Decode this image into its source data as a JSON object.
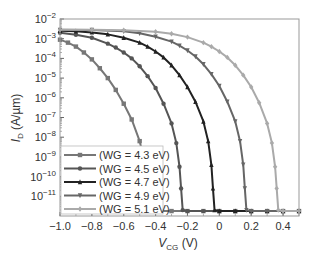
{
  "chart_data": {
    "type": "line",
    "title": "",
    "xlabel": "V",
    "xlabel_sub": "CG",
    "xlabel_unit": " (V)",
    "ylabel": "I",
    "ylabel_sub": "D",
    "ylabel_unit": " (A/µm)",
    "xlim": [
      -1.0,
      0.5
    ],
    "ylim_log10": [
      -12,
      -2
    ],
    "yscale": "log",
    "grid": false,
    "legend_position": "bottom-left",
    "x_ticks": [
      -1.0,
      -0.8,
      -0.6,
      -0.4,
      -0.2,
      0,
      0.2,
      0.4
    ],
    "x_tick_labels": [
      "−1.0",
      "−0.8",
      "−0.6",
      "−0.4",
      "−0.2",
      "0",
      "0.2",
      "0.4"
    ],
    "y_ticks_log10": [
      -2,
      -3,
      -4,
      -5,
      -6,
      -7,
      -8,
      -9,
      -10,
      -11
    ],
    "y_tick_labels": [
      {
        "base": "10",
        "exp": "−2"
      },
      {
        "base": "10",
        "exp": "−3"
      },
      {
        "base": "10",
        "exp": "−4"
      },
      {
        "base": "10",
        "exp": "−5"
      },
      {
        "base": "10",
        "exp": "−6"
      },
      {
        "base": "10",
        "exp": "−7"
      },
      {
        "base": "10",
        "exp": "−8"
      },
      {
        "base": "10",
        "exp": "−9"
      },
      {
        "base": "10",
        "exp": "−10"
      },
      {
        "base": "10",
        "exp": "−11"
      }
    ],
    "series": [
      {
        "name": "(WG = 4.3 eV)",
        "color": "#777777",
        "marker": "square",
        "x": [
          -1.0,
          -0.95,
          -0.9,
          -0.85,
          -0.8,
          -0.75,
          -0.7,
          -0.65,
          -0.6,
          -0.55,
          -0.5,
          -0.47,
          -0.45,
          -0.44,
          -0.43,
          -0.4,
          -0.3,
          -0.2,
          -0.1,
          0,
          0.1,
          0.2,
          0.3,
          0.4,
          0.5
        ],
        "log10_y": [
          -3.05,
          -3.2,
          -3.4,
          -3.7,
          -4.05,
          -4.5,
          -5.0,
          -5.6,
          -6.3,
          -7.1,
          -8.2,
          -9.2,
          -10.2,
          -11.0,
          -11.7,
          -11.75,
          -11.75,
          -11.75,
          -11.75,
          -11.75,
          -11.75,
          -11.75,
          -11.75,
          -11.75,
          -11.75
        ]
      },
      {
        "name": "(WG = 4.5 eV)",
        "color": "#555555",
        "marker": "circle",
        "x": [
          -1.0,
          -0.9,
          -0.8,
          -0.7,
          -0.65,
          -0.6,
          -0.55,
          -0.5,
          -0.45,
          -0.4,
          -0.35,
          -0.3,
          -0.27,
          -0.25,
          -0.24,
          -0.23,
          -0.2,
          -0.1,
          0,
          0.1,
          0.2,
          0.3,
          0.4,
          0.5
        ],
        "log10_y": [
          -2.7,
          -2.8,
          -2.95,
          -3.25,
          -3.45,
          -3.7,
          -4.0,
          -4.4,
          -4.9,
          -5.5,
          -6.3,
          -7.3,
          -8.3,
          -9.5,
          -10.6,
          -11.7,
          -11.75,
          -11.75,
          -11.75,
          -11.75,
          -11.75,
          -11.75,
          -11.75,
          -11.75
        ]
      },
      {
        "name": "(WG = 4.7 eV)",
        "color": "#222222",
        "marker": "triangle",
        "x": [
          -1.0,
          -0.9,
          -0.8,
          -0.7,
          -0.6,
          -0.5,
          -0.45,
          -0.4,
          -0.35,
          -0.3,
          -0.25,
          -0.2,
          -0.15,
          -0.1,
          -0.07,
          -0.05,
          -0.04,
          -0.03,
          0,
          0.1,
          0.2,
          0.3,
          0.4,
          0.5
        ],
        "log10_y": [
          -2.6,
          -2.62,
          -2.68,
          -2.78,
          -2.95,
          -3.2,
          -3.4,
          -3.65,
          -3.95,
          -4.35,
          -4.85,
          -5.45,
          -6.2,
          -7.2,
          -8.2,
          -9.4,
          -10.6,
          -11.7,
          -11.75,
          -11.75,
          -11.75,
          -11.75,
          -11.75,
          -11.75
        ]
      },
      {
        "name": "(WG = 4.9 eV)",
        "color": "#666666",
        "marker": "down-triangle",
        "x": [
          -1.0,
          -0.8,
          -0.6,
          -0.5,
          -0.4,
          -0.3,
          -0.25,
          -0.2,
          -0.15,
          -0.1,
          -0.05,
          0,
          0.05,
          0.1,
          0.13,
          0.15,
          0.16,
          0.17,
          0.2,
          0.3,
          0.4,
          0.5
        ],
        "log10_y": [
          -2.55,
          -2.56,
          -2.62,
          -2.72,
          -2.9,
          -3.15,
          -3.35,
          -3.6,
          -3.9,
          -4.3,
          -4.8,
          -5.4,
          -6.2,
          -7.2,
          -8.2,
          -9.4,
          -10.6,
          -11.7,
          -11.75,
          -11.75,
          -11.75,
          -11.75
        ]
      },
      {
        "name": "(WG = 5.1 eV)",
        "color": "#aaaaaa",
        "marker": "diamond",
        "x": [
          -1.0,
          -0.8,
          -0.6,
          -0.4,
          -0.3,
          -0.2,
          -0.1,
          -0.05,
          0,
          0.05,
          0.1,
          0.15,
          0.2,
          0.25,
          0.3,
          0.33,
          0.35,
          0.36,
          0.37,
          0.4,
          0.5
        ],
        "log10_y": [
          -2.55,
          -2.55,
          -2.57,
          -2.65,
          -2.75,
          -2.92,
          -3.2,
          -3.4,
          -3.65,
          -3.95,
          -4.35,
          -4.85,
          -5.45,
          -6.25,
          -7.3,
          -8.3,
          -9.5,
          -10.6,
          -11.7,
          -11.75,
          -11.75
        ]
      }
    ]
  }
}
